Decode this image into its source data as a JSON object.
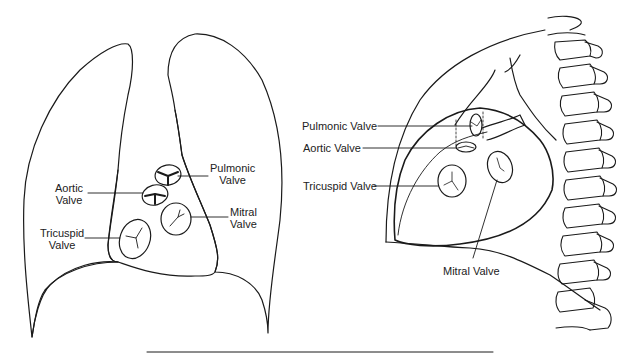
{
  "frontal_view": {
    "labels": {
      "pulmonic": [
        "Pulmonic",
        "Valve"
      ],
      "aortic": [
        "Aortic",
        "Valve"
      ],
      "mitral": [
        "Mitral",
        "Valve"
      ],
      "tricuspid": [
        "Tricuspid",
        "Valve"
      ]
    }
  },
  "lateral_view": {
    "labels": {
      "pulmonic": "Pulmonic Valve",
      "aortic": "Aortic Valve",
      "tricuspid": "Tricuspid Valve",
      "mitral": "Mitral Valve"
    }
  },
  "colors": {
    "line": "#1a1a1a",
    "background": "#ffffff"
  }
}
